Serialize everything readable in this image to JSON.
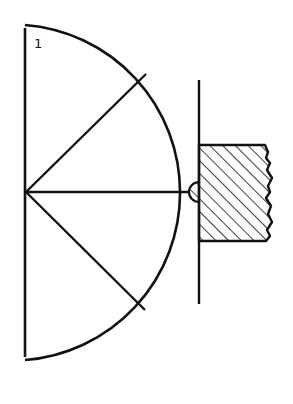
{
  "diagram": {
    "figure_label": "1",
    "stroke_color": "#111111",
    "background_color": "#ffffff",
    "center": {
      "x": 26,
      "y": 192
    },
    "large_arc": {
      "start": {
        "x": 25,
        "y": 25
      },
      "end": {
        "x": 25,
        "y": 360
      },
      "radius": 168
    },
    "left_axis_line": {
      "x": 25,
      "y1": 28,
      "y2": 357
    },
    "radial_lines": [
      {
        "name": "upper-radius",
        "x2": 146,
        "y2": 74
      },
      {
        "name": "horizontal-radius",
        "x2": 189,
        "y2": 192
      },
      {
        "name": "lower-radius",
        "x2": 145,
        "y2": 310
      }
    ],
    "plate_line": {
      "x": 199,
      "y1": 80,
      "y2": 304
    },
    "hatched_block": {
      "left": 199,
      "top": 145,
      "bottom": 241,
      "right_edge": "jagged"
    },
    "contact_semicircle": {
      "cx": 199,
      "cy": 192,
      "r": 10
    }
  }
}
